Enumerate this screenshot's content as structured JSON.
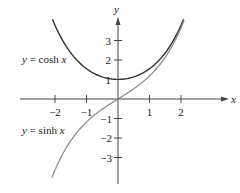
{
  "chart_data": {
    "type": "line",
    "title": "",
    "xlabel": "x",
    "ylabel": "y",
    "xlim": [
      -2.1,
      2.1
    ],
    "ylim": [
      -4.1,
      4.1
    ],
    "grid": false,
    "x_ticks": [
      -2,
      -1,
      1,
      2
    ],
    "y_ticks": [
      -3,
      -2,
      -1,
      1,
      2,
      3
    ],
    "x_tick_labels": [
      "−2",
      "−1",
      "1",
      "2"
    ],
    "y_tick_labels": [
      "−3",
      "−2",
      "−1",
      "1",
      "2",
      "3"
    ],
    "series": [
      {
        "name": "y = cosh x",
        "function": "cosh",
        "color": "#333333",
        "x": [
          -2,
          -1.5,
          -1,
          -0.5,
          0,
          0.5,
          1,
          1.5,
          2
        ],
        "values": [
          3.76,
          2.35,
          1.54,
          1.13,
          1.0,
          1.13,
          1.54,
          2.35,
          3.76
        ]
      },
      {
        "name": "y = sinh x",
        "function": "sinh",
        "color": "#888888",
        "x": [
          -2,
          -1.5,
          -1,
          -0.5,
          0,
          0.5,
          1,
          1.5,
          2
        ],
        "values": [
          -3.63,
          -2.13,
          -1.18,
          -0.52,
          0.0,
          0.52,
          1.18,
          2.13,
          3.63
        ]
      }
    ],
    "annotations": [
      {
        "text": "y = cosh x",
        "x_px": 22,
        "y_px": 63
      },
      {
        "text": "y = sinh x",
        "x_px": 22,
        "y_px": 134
      }
    ]
  },
  "labels": {
    "x_axis": "x",
    "y_axis": "y",
    "cosh_eq_lhs": "y",
    "cosh_eq_rhs": " = cosh ",
    "cosh_eq_var": "x",
    "sinh_eq_lhs": "y",
    "sinh_eq_rhs": " = sinh ",
    "sinh_eq_var": "x",
    "xt_m2": "−2",
    "xt_m1": "−1",
    "xt_1": "1",
    "xt_2": "2",
    "yt_3": "3",
    "yt_2": "2",
    "yt_1": "1",
    "yt_m1": "−1",
    "yt_m2": "−2",
    "yt_m3": "−3"
  }
}
